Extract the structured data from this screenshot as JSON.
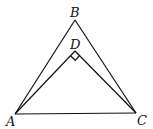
{
  "diagram": {
    "type": "geometry-figure",
    "points": {
      "A": {
        "label": "A",
        "x": 15,
        "y": 114
      },
      "B": {
        "label": "B",
        "x": 75,
        "y": 20
      },
      "C": {
        "label": "C",
        "x": 136,
        "y": 113
      },
      "D": {
        "label": "D",
        "x": 75,
        "y": 51
      }
    },
    "segments": [
      "AB",
      "BC",
      "AC",
      "AD",
      "DC"
    ],
    "right_angle_at": "D",
    "colors": {
      "stroke": "#111111",
      "background": "#ffffff"
    }
  }
}
